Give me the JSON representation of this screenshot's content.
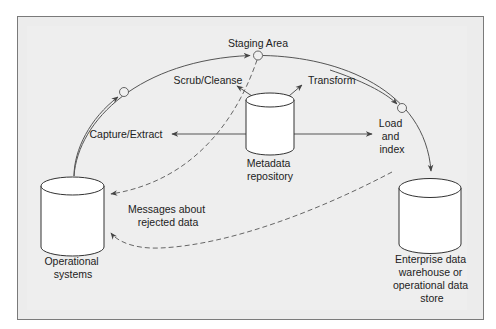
{
  "diagram": {
    "nodes": {
      "staging_area": "Staging Area",
      "scrub_cleanse": "Scrub/Cleanse",
      "transform": "Transform",
      "capture_extract": "Capture/Extract",
      "load_index": [
        "Load",
        "and",
        "index"
      ],
      "metadata_repository": [
        "Metadata",
        "repository"
      ],
      "operational_systems": [
        "Operational",
        "systems"
      ],
      "rejected_messages": [
        "Messages about",
        "rejected data"
      ],
      "enterprise_store": [
        "Enterprise data",
        "warehouse or",
        "operational data",
        "store"
      ]
    },
    "edges": [
      {
        "from": "Operational systems",
        "to": "Staging Area",
        "style": "solid"
      },
      {
        "from": "Staging Area",
        "to": "Enterprise data warehouse or operational data store",
        "style": "solid"
      },
      {
        "from": "Metadata repository",
        "to": "Capture/Extract",
        "style": "solid"
      },
      {
        "from": "Metadata repository",
        "to": "Scrub/Cleanse",
        "style": "solid"
      },
      {
        "from": "Metadata repository",
        "to": "Transform",
        "style": "solid"
      },
      {
        "from": "Metadata repository",
        "to": "Load and index",
        "style": "solid"
      },
      {
        "from": "Staging Area",
        "to": "Operational systems",
        "style": "dashed"
      },
      {
        "from": "Load and index",
        "to": "Operational systems",
        "style": "dashed"
      }
    ],
    "colors": {
      "frame_border": "#7a7a7a",
      "frame_fill": "#ececec",
      "line": "#555555",
      "text": "#222222"
    }
  }
}
